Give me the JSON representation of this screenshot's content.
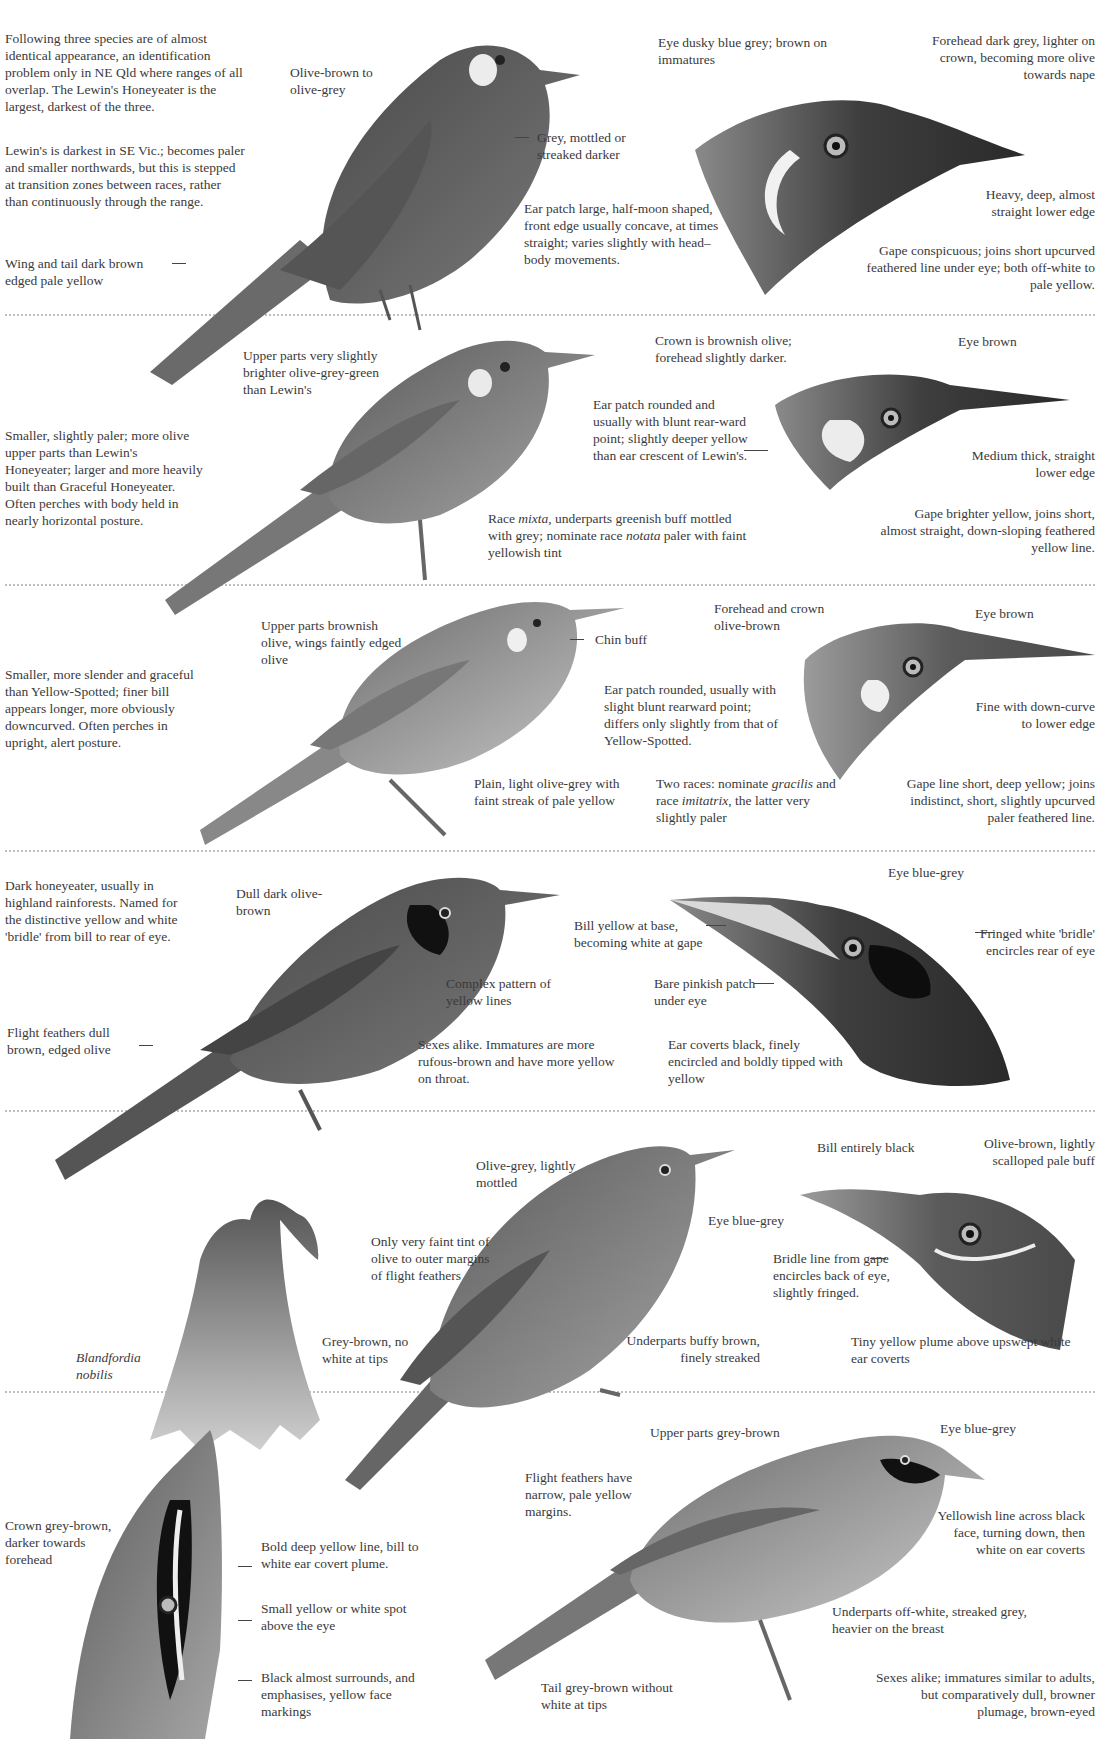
{
  "separators_y": [
    314,
    584,
    850,
    1110,
    1391
  ],
  "sections": [
    {
      "species": "lewins-honeyeater",
      "intro": "Following three species are of almost identical appearance, an identification problem only in NE Qld where ranges of all overlap.  The Lewin's Honeyeater is the largest, darkest of the three.",
      "variation": "Lewin's is darkest in SE Vic.; becomes paler and smaller northwards, but this is stepped at transition zones between races, rather than continuously through the range.",
      "wing_tail": "Wing and tail dark brown edged pale yellow",
      "upperparts": "Olive-brown to olive-grey",
      "underparts": "Grey, mottled or streaked darker",
      "ear_patch": "Ear patch large, half-moon shaped, front edge usually concave, at times straight; varies slightly with head–body movements.",
      "head": {
        "eye": "Eye dusky blue grey; brown on immatures",
        "forehead": "Forehead dark grey, lighter on crown, becoming more olive towards nape",
        "bill": "Heavy, deep, almost straight lower edge",
        "gape": "Gape conspicuous; joins short upcurved feathered line under eye; both off-white to pale yellow."
      }
    },
    {
      "species": "yellow-spotted-honeyeater",
      "description": "Smaller, slightly paler; more olive upper parts than Lewin's Honeyeater; larger and more heavily built than Graceful Honeyeater.  Often perches with body held in nearly horizontal posture.",
      "upperparts": "Upper parts very slightly brighter olive-grey-green than Lewin's",
      "underparts_pre": "Race ",
      "underparts_race1": "mixta",
      "underparts_mid": ", underparts greenish buff mottled with grey; nominate race ",
      "underparts_race2": "notata",
      "underparts_post": " paler with faint yellowish tint",
      "ear_patch": "Ear patch rounded and usually with blunt rear-ward point; slightly deeper yellow than ear crescent of Lewin's.",
      "head": {
        "crown": "Crown is brownish olive; forehead slightly darker.",
        "eye": "Eye brown",
        "bill": "Medium thick, straight lower edge",
        "gape": "Gape brighter yellow, joins short, almost straight, down-sloping feathered yellow line."
      }
    },
    {
      "species": "graceful-honeyeater",
      "description": "Smaller, more slender and graceful than Yellow-Spotted; finer bill appears longer, more obviously downcurved. Often perches in upright, alert posture.",
      "upperparts": "Upper parts brownish olive, wings faintly edged olive",
      "chin": "Chin buff",
      "underparts": "Plain, light olive-grey with faint streak of pale yellow",
      "ear_patch": "Ear patch rounded, usually with slight blunt rearward point; differs only slightly from that of Yellow-Spotted.",
      "races_pre": "Two races: nominate ",
      "races_r1": "gracilis",
      "races_mid": " and race ",
      "races_r2": "imitatrix",
      "races_post": ", the latter very slightly paler",
      "head": {
        "forehead": "Forehead and crown olive-brown",
        "eye": "Eye brown",
        "bill": "Fine with down-curve to lower edge",
        "gape": "Gape line short, deep yellow; joins indistinct, short, slightly upcurved paler feathered line."
      }
    },
    {
      "species": "bridled-honeyeater",
      "description": "Dark honeyeater, usually in highland rainforests. Named for the distinctive yellow and white 'bridle' from bill to rear of eye.",
      "upperparts": "Dull dark olive-brown",
      "flight_feathers": "Flight feathers dull brown, edged olive",
      "face": "Complex pattern of yellow lines",
      "sexes": "Sexes alike.  Immatures are more rufous-brown and have more yellow on throat.",
      "head": {
        "eye": "Eye blue-grey",
        "bill": "Bill yellow at base, becoming white at gape",
        "bridle": "Fringed white 'bridle' encircles rear of eye",
        "bare_patch": "Bare pinkish patch under eye",
        "ear_coverts": "Ear coverts black, finely encircled and boldly tipped with yellow"
      }
    },
    {
      "species": "eungella-honeyeater",
      "mantle": "Olive-grey, lightly mottled",
      "flight_feathers": "Only very faint tint of olive to outer margins of flight feathers",
      "tail": "Grey-brown, no white at tips",
      "eye": "Eye blue-grey",
      "underparts": "Underparts buffy brown, finely streaked",
      "plant_label": "Blandfordia nobilis",
      "head": {
        "bill": "Bill entirely black",
        "crown": "Olive-brown, lightly scalloped pale buff",
        "bridle": "Bridle line from gape encircles back of eye, slightly fringed.",
        "plume": "Tiny yellow plume above upswept white ear coverts"
      }
    },
    {
      "species": "white-eared-like-honeyeater",
      "crown": "Crown grey-brown, darker towards forehead",
      "yellow_line": "Bold deep yellow line, bill to white ear covert plume.",
      "spot": "Small yellow or white spot above the eye",
      "black": "Black almost surrounds, and emphasises, yellow face markings",
      "upperparts": "Upper parts grey-brown",
      "eye": "Eye blue-grey",
      "flight_feathers": "Flight feathers have narrow, pale yellow margins.",
      "face_line": "Yellowish line across black face, turning down, then white on ear coverts",
      "underparts": "Underparts off-white, streaked grey, heavier on the breast",
      "tail": "Tail grey-brown without white at tips",
      "sexes": "Sexes alike; immatures similar to adults, but comparatively dull, browner plumage, brown-eyed"
    }
  ]
}
